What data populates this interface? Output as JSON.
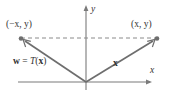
{
  "figure": {
    "kind": "linear-transformation-reflection-diagram",
    "colors": {
      "stroke": "#6e6e6e",
      "text": "#333333",
      "axis": "#7a7a7a",
      "dash": "#8a8a8a",
      "background": "#ffffff"
    },
    "axes": {
      "x_label": "x",
      "y_label": "y",
      "origin": {
        "x": 86,
        "y": 82
      },
      "x_axis_start": {
        "x": 18,
        "y": 82
      },
      "x_axis_end": {
        "x": 152,
        "y": 82
      },
      "y_axis_start": {
        "x": 86,
        "y": 90
      },
      "y_axis_end": {
        "x": 86,
        "y": 6
      },
      "arrowheads": [
        "x-positive",
        "y-positive"
      ]
    },
    "points": [
      {
        "name": "reflected-point",
        "label": "(−x, y)",
        "coords": {
          "x": 21,
          "y": 38
        },
        "label_pos": {
          "x": 6,
          "y": 20
        }
      },
      {
        "name": "original-point",
        "label": "(x, y)",
        "coords": {
          "x": 157,
          "y": 38
        },
        "label_pos": {
          "x": 131,
          "y": 20
        }
      }
    ],
    "vectors": [
      {
        "name": "vector-w",
        "label": "w = T(x)",
        "label_parts": {
          "lhs": "w",
          "eq": "=",
          "fn": "T",
          "arg": "x"
        },
        "from": {
          "x": 86,
          "y": 82
        },
        "to": {
          "x": 21,
          "y": 38
        },
        "label_pos": {
          "x": 13,
          "y": 57
        }
      },
      {
        "name": "vector-x",
        "label": "x",
        "from": {
          "x": 86,
          "y": 82
        },
        "to": {
          "x": 157,
          "y": 38
        },
        "label_pos": {
          "x": 113,
          "y": 59
        }
      }
    ],
    "dashed_line": {
      "name": "horizontal-dashed-connector",
      "from": {
        "x": 21,
        "y": 38
      },
      "to": {
        "x": 157,
        "y": 38
      },
      "dash_pattern": "4 3"
    }
  }
}
